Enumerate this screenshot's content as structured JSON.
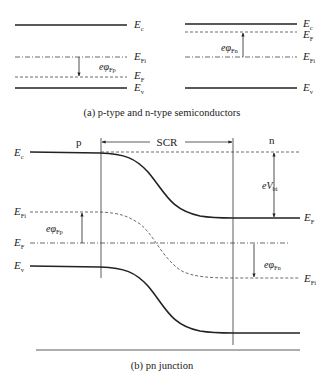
{
  "figure": {
    "part_a": {
      "caption": "(a) p-type and n-type semiconductors",
      "p_type": {
        "levels": [
          {
            "name": "Ec",
            "base": "E",
            "sub": "c",
            "style": "solid"
          },
          {
            "name": "EFi",
            "base": "E",
            "sub": "Fi",
            "style": "dash-dot"
          },
          {
            "name": "EF",
            "base": "E",
            "sub": "F",
            "style": "dashed"
          },
          {
            "name": "Ev",
            "base": "E",
            "sub": "v",
            "style": "solid"
          }
        ],
        "potential": {
          "base": "eφ",
          "sub": "Fp",
          "direction": "down"
        }
      },
      "n_type": {
        "levels": [
          {
            "name": "Ec",
            "base": "E",
            "sub": "c",
            "style": "solid"
          },
          {
            "name": "EF",
            "base": "E",
            "sub": "F",
            "style": "dashed"
          },
          {
            "name": "EFi",
            "base": "E",
            "sub": "Fi",
            "style": "dash-dot"
          },
          {
            "name": "Ev",
            "base": "E",
            "sub": "v",
            "style": "solid"
          }
        ],
        "potential": {
          "base": "eφ",
          "sub": "Fn",
          "direction": "up"
        }
      }
    },
    "part_b": {
      "caption": "(b) pn junction",
      "region_p": "p",
      "region_n": "n",
      "scr_label": "SCR",
      "left_labels": [
        {
          "base": "E",
          "sub": "c"
        },
        {
          "base": "E",
          "sub": "Fi"
        },
        {
          "base": "E",
          "sub": "F"
        },
        {
          "base": "E",
          "sub": "v"
        }
      ],
      "right_labels": [
        {
          "base": "E",
          "sub": "F"
        },
        {
          "base": "E",
          "sub": "Fi"
        }
      ],
      "annotations": {
        "vbi": {
          "base": "eV",
          "sub": "bi"
        },
        "phi_fp": {
          "base": "eφ",
          "sub": "Fp"
        },
        "phi_fn": {
          "base": "eφ",
          "sub": "Fn"
        }
      }
    }
  }
}
